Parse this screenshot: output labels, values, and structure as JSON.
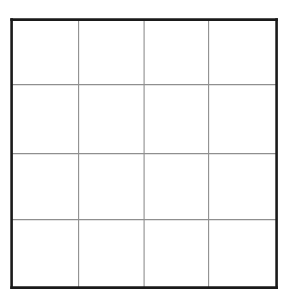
{
  "figure": {
    "name": "empty-4x4-grid",
    "kind": "grid-table",
    "caption": "",
    "background_color": "#ffffff"
  },
  "canvas": {
    "width": 291,
    "height": 305,
    "background_color": "#ffffff"
  },
  "grid": {
    "rows": 4,
    "columns": 4,
    "cell_count": 16,
    "bounds": {
      "left": 12,
      "top": 20,
      "right": 277,
      "bottom": 288,
      "width": 265,
      "height": 268
    },
    "border": {
      "color": "#1a1a1a",
      "width_px": 2.6,
      "style": "solid"
    },
    "inner_lines": {
      "color": "#8f8f8f",
      "width_px": 1.1,
      "style": "solid"
    },
    "vertical_line_x": [
      79,
      144.5,
      209
    ],
    "horizontal_line_y": [
      85,
      154,
      220
    ],
    "cell_fill": "#ffffff",
    "cells": [
      {
        "row": 1,
        "column": 1,
        "label": ""
      },
      {
        "row": 1,
        "column": 2,
        "label": ""
      },
      {
        "row": 1,
        "column": 3,
        "label": ""
      },
      {
        "row": 1,
        "column": 4,
        "label": ""
      },
      {
        "row": 2,
        "column": 1,
        "label": ""
      },
      {
        "row": 2,
        "column": 2,
        "label": ""
      },
      {
        "row": 2,
        "column": 3,
        "label": ""
      },
      {
        "row": 2,
        "column": 4,
        "label": ""
      },
      {
        "row": 3,
        "column": 1,
        "label": ""
      },
      {
        "row": 3,
        "column": 2,
        "label": ""
      },
      {
        "row": 3,
        "column": 3,
        "label": ""
      },
      {
        "row": 3,
        "column": 4,
        "label": ""
      },
      {
        "row": 4,
        "column": 1,
        "label": ""
      },
      {
        "row": 4,
        "column": 2,
        "label": ""
      },
      {
        "row": 4,
        "column": 3,
        "label": ""
      },
      {
        "row": 4,
        "column": 4,
        "label": ""
      }
    ]
  }
}
